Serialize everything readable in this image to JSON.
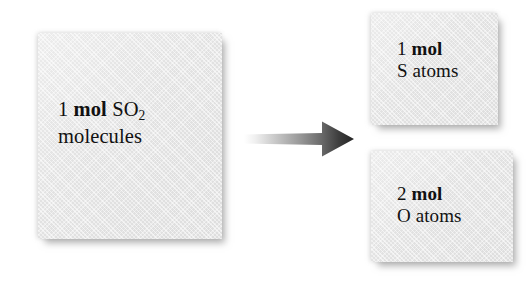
{
  "diagram": {
    "background_color": "#ffffff",
    "box_fill_color": "#e4e4e4",
    "text_color": "#111111",
    "arrow": {
      "icon": "right-arrow-icon",
      "direction": "right",
      "gradient_from": "#ffffff",
      "gradient_to": "#2b2b2b"
    },
    "reactant": {
      "quantity": "1",
      "unit": "mol",
      "formula": "SO",
      "formula_subscript": "2",
      "species": "molecules"
    },
    "products": [
      {
        "quantity": "1",
        "unit": "mol",
        "species": "S atoms"
      },
      {
        "quantity": "2",
        "unit": "mol",
        "species": "O atoms"
      }
    ]
  }
}
